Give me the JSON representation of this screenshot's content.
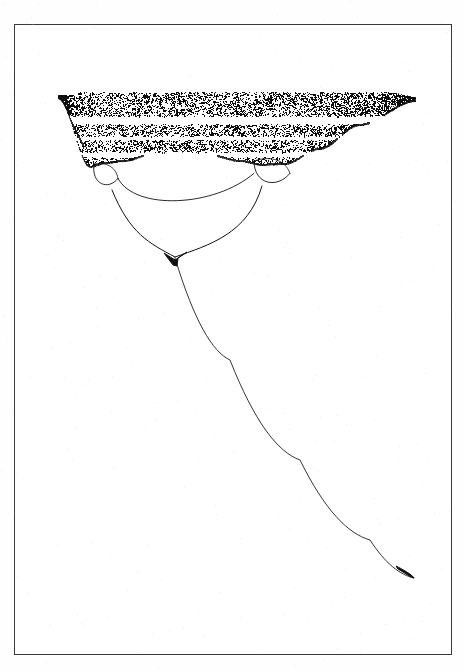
{
  "page": {
    "background_color": "#fefefe",
    "width": 464,
    "height": 672,
    "top_caption": "",
    "document_kind": "scanned-figure-page"
  },
  "frame": {
    "name": "figure-border",
    "stroke_color": "#3a3a3c",
    "x": 14,
    "y": 24,
    "width": 438,
    "height": 631
  },
  "figure": {
    "title": "",
    "caption": "",
    "ink_color": "#111111"
  },
  "chart_data": {
    "type": "scatter",
    "title": "",
    "subtitle": "",
    "xlabel": "",
    "ylabel": "",
    "xlim": [
      0,
      1
    ],
    "ylim": [
      0,
      1
    ],
    "grid": false,
    "legend": null,
    "axis_visible": false,
    "tick_labels_x": [],
    "tick_labels_y": [],
    "orientation": "inverted-vertical",
    "regions": [
      {
        "name": "chaotic-band",
        "kind": "speckle-wedge",
        "point_count": 9000,
        "top_y": 92,
        "left_apex": [
          58,
          95
        ],
        "right_apex": [
          416,
          100
        ],
        "white_bands": [
          {
            "label": "band-gap-1",
            "y_top": 116,
            "y_bottom": 124
          },
          {
            "label": "band-gap-2",
            "y_top": 136,
            "y_bottom": 140
          },
          {
            "label": "band-gap-3",
            "y_top": 152,
            "y_bottom": 157
          }
        ]
      },
      {
        "name": "period-4-bubble-left",
        "kind": "closed-loop",
        "cx": 106,
        "cy": 176,
        "rx": 12,
        "ry": 12
      },
      {
        "name": "period-4-bubble-right",
        "kind": "closed-loop",
        "cx": 272,
        "cy": 172,
        "rx": 18,
        "ry": 13
      },
      {
        "name": "period-2-branch-pair",
        "kind": "branch-arc-pair",
        "merge_point": [
          175,
          257
        ],
        "left_anchor": [
          112,
          190
        ],
        "right_anchor": [
          262,
          186
        ]
      },
      {
        "name": "fixed-point-curve",
        "kind": "single-curve",
        "start": [
          175,
          258
        ],
        "end": [
          414,
          578
        ],
        "terminal_hook": true
      }
    ],
    "series": [
      {
        "name": "attractor-branch-outer-left",
        "points": [
          [
            58,
            95
          ],
          [
            120,
            150
          ],
          [
            175,
            257
          ]
        ]
      },
      {
        "name": "attractor-branch-outer-right",
        "points": [
          [
            416,
            100
          ],
          [
            300,
            170
          ],
          [
            175,
            257
          ]
        ]
      },
      {
        "name": "attractor-fixed-point",
        "points": [
          [
            175,
            258
          ],
          [
            230,
            360
          ],
          [
            300,
            460
          ],
          [
            370,
            540
          ],
          [
            414,
            578
          ]
        ]
      }
    ]
  },
  "colors": {
    "ink": "#111111",
    "frame": "#3a3a3c",
    "paper": "#fefefe",
    "speckle": "#0d0d0d"
  }
}
